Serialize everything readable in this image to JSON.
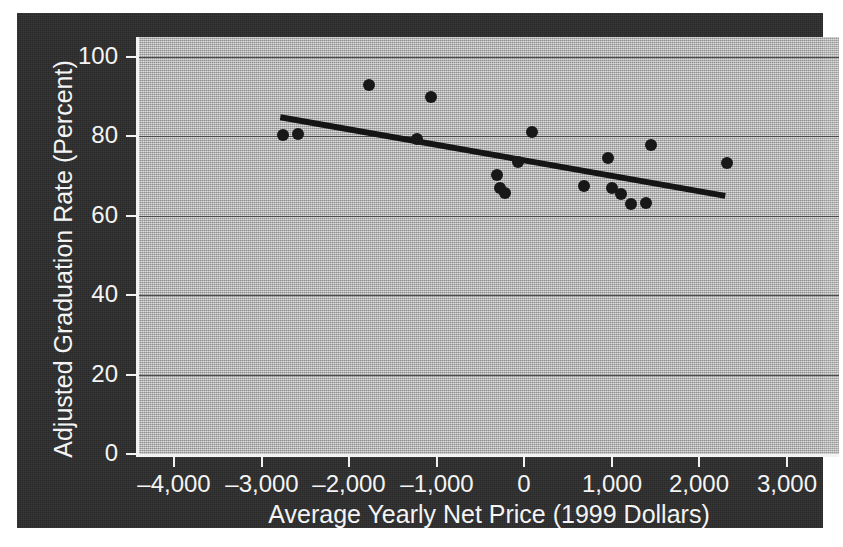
{
  "chart_data": {
    "type": "scatter",
    "title": "",
    "xlabel": "Average Yearly Net Price (1999 Dollars)",
    "ylabel": "Adjusted Graduation Rate (Percent)",
    "xlim": [
      -4400,
      3600
    ],
    "ylim": [
      0,
      105
    ],
    "xticks": [
      -4000,
      -3000,
      -2000,
      -1000,
      0,
      1000,
      2000,
      3000
    ],
    "xtick_labels": [
      "–4,000",
      "–3,000",
      "–2,000",
      "–1,000",
      "0",
      "1,000",
      "2,000",
      "3,000"
    ],
    "yticks": [
      0,
      20,
      40,
      60,
      80,
      100
    ],
    "ytick_labels": [
      "0",
      "20",
      "40",
      "60",
      "80",
      "100"
    ],
    "grid": "horizontal",
    "legend": "none",
    "points": [
      {
        "x": -2760,
        "y": 80.2
      },
      {
        "x": -2580,
        "y": 80.6
      },
      {
        "x": -1775,
        "y": 93.0
      },
      {
        "x": -1065,
        "y": 90.0
      },
      {
        "x": -1225,
        "y": 79.4
      },
      {
        "x": -310,
        "y": 70.3
      },
      {
        "x": -280,
        "y": 67.0
      },
      {
        "x": -215,
        "y": 65.8
      },
      {
        "x": -65,
        "y": 73.6
      },
      {
        "x": 90,
        "y": 81.2
      },
      {
        "x": 690,
        "y": 67.6
      },
      {
        "x": 955,
        "y": 74.6
      },
      {
        "x": 1010,
        "y": 67.0
      },
      {
        "x": 1110,
        "y": 65.5
      },
      {
        "x": 1225,
        "y": 63.0
      },
      {
        "x": 1395,
        "y": 63.3
      },
      {
        "x": 1450,
        "y": 77.8
      },
      {
        "x": 2320,
        "y": 73.3
      }
    ],
    "trendline": {
      "x_start": -2785,
      "y_start": 84.8,
      "x_end": 2300,
      "y_end": 65.0,
      "style": "solid",
      "color": "#151515",
      "width_px": 6
    },
    "colors": {
      "plot_background": "#b9b9b9",
      "frame_background": "#2b2b2b",
      "axis_text": "#f4f4f4",
      "gridline": "#4a4a4a",
      "marker": "#181818"
    }
  }
}
